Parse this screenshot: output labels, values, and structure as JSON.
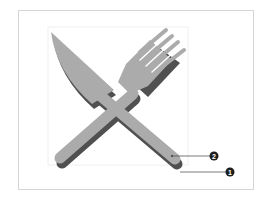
{
  "figure": {
    "colors": {
      "face": "#ababab",
      "shadow": "#505050",
      "frame": "#d6d6d6",
      "guide": "#ececec",
      "leader": "#555555",
      "callout_fill": "#1e1e1e"
    }
  },
  "callouts": [
    {
      "number": "2",
      "target": "top face layer"
    },
    {
      "number": "1",
      "target": "shadow layer"
    }
  ]
}
